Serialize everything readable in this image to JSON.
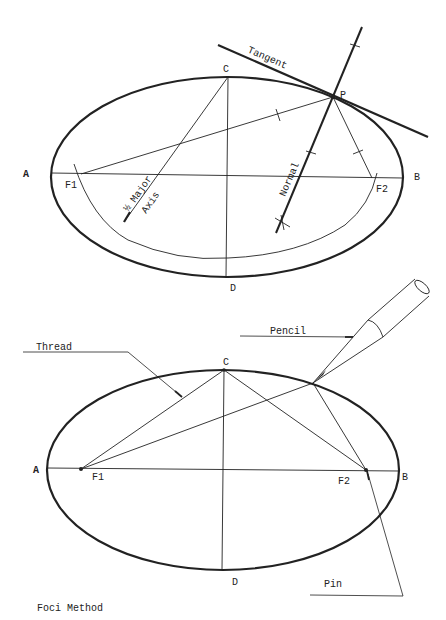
{
  "figure": {
    "caption": "Foci Method",
    "colors": {
      "ink": "#222222",
      "background": "#ffffff"
    }
  },
  "top_diagram": {
    "labels": {
      "A": "A",
      "B": "B",
      "C": "C",
      "D": "D",
      "F1": "F1",
      "F2": "F2",
      "P": "P",
      "tangent": "Tangent",
      "normal": "Normal",
      "half_major_axis_fraction": "½",
      "half_major_axis_text1": "Major",
      "half_major_axis_text2": "Axis"
    }
  },
  "bottom_diagram": {
    "labels": {
      "A": "A",
      "B": "B",
      "C": "C",
      "D": "D",
      "F1": "F1",
      "F2": "F2",
      "thread": "Thread",
      "pencil": "Pencil",
      "pin": "Pin"
    }
  }
}
